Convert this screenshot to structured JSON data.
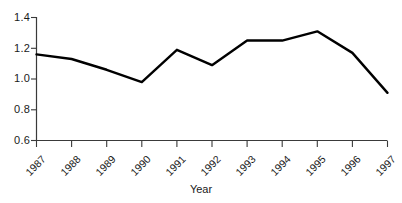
{
  "chart_data": {
    "type": "line",
    "title": "",
    "subtitle": "",
    "xlabel": "Year",
    "ylabel": "",
    "categories": [
      "1987",
      "1988",
      "1989",
      "1990",
      "1991",
      "1992",
      "1993",
      "1994",
      "1995",
      "1996",
      "1997"
    ],
    "values": [
      1.16,
      1.13,
      1.06,
      0.98,
      1.19,
      1.09,
      1.25,
      1.25,
      1.31,
      1.17,
      0.91
    ],
    "series": [
      {
        "name": "",
        "values": [
          1.16,
          1.13,
          1.06,
          0.98,
          1.19,
          1.09,
          1.25,
          1.25,
          1.31,
          1.17,
          0.91
        ]
      }
    ],
    "ylim": [
      0.6,
      1.4
    ],
    "yticks": [
      "0.6",
      "0.8",
      "1.0",
      "1.2",
      "1.4"
    ],
    "ytick_values": [
      0.6,
      0.8,
      1.0,
      1.2,
      1.4
    ],
    "xtick_labels": [
      "1987",
      "1988",
      "1989",
      "1990",
      "1991",
      "1992",
      "1993",
      "1994",
      "1995",
      "1996",
      "1997"
    ],
    "grid": false,
    "legend": false,
    "legend_position": "none",
    "line_color": "#000000",
    "axis_color": "#333333",
    "background_color": "#ffffff",
    "markers": false,
    "xlabel_rotation": "-45"
  },
  "axis": {
    "x_title": "Year",
    "y_tick_0": "0.6",
    "y_tick_1": "0.8",
    "y_tick_2": "1.0",
    "y_tick_3": "1.2",
    "y_tick_4": "1.4",
    "x_tick_0": "1987",
    "x_tick_1": "1988",
    "x_tick_2": "1989",
    "x_tick_3": "1990",
    "x_tick_4": "1991",
    "x_tick_5": "1992",
    "x_tick_6": "1993",
    "x_tick_7": "1994",
    "x_tick_8": "1995",
    "x_tick_9": "1996",
    "x_tick_10": "1997"
  }
}
